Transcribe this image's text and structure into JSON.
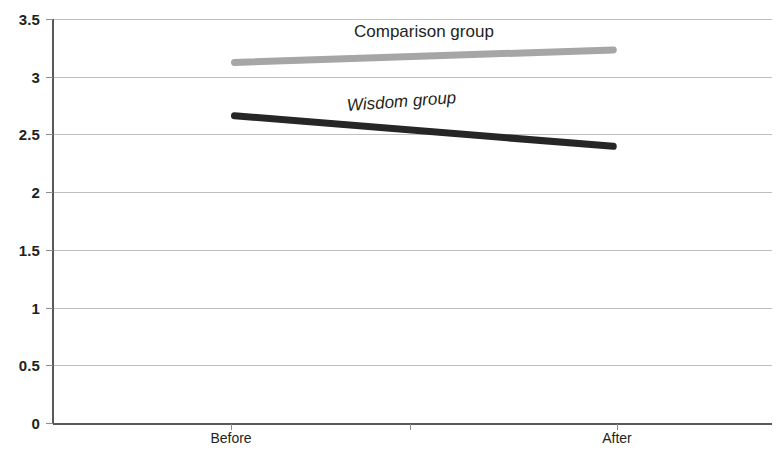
{
  "chart_data": {
    "type": "line",
    "title": "",
    "xlabel": "",
    "ylabel": "",
    "categories": [
      "Before",
      "After"
    ],
    "x": [
      0,
      1
    ],
    "ylim": [
      0,
      3.5
    ],
    "yticks": [
      0,
      0.5,
      1,
      1.5,
      2,
      2.5,
      3,
      3.5
    ],
    "ytick_labels": [
      "0",
      "0.5",
      "1",
      "1.5",
      "2",
      "2.5",
      "3",
      "3.5"
    ],
    "grid": true,
    "legend_position": "inline-annotation",
    "series": [
      {
        "name": "Comparison group",
        "values": [
          3.12,
          3.23
        ],
        "color": "#a6a6a6",
        "linewidth": 7,
        "label_style": "normal"
      },
      {
        "name": "Wisdom group",
        "values": [
          2.66,
          2.39
        ],
        "color": "#262626",
        "linewidth": 7,
        "label_style": "italic"
      }
    ],
    "annotations": [
      {
        "text": "Comparison group",
        "series": "Comparison group",
        "style": "normal"
      },
      {
        "text": "Wisdom group",
        "series": "Wisdom group",
        "style": "italic"
      }
    ]
  },
  "colors": {
    "comparison": "#a6a6a6",
    "wisdom": "#262626",
    "gridline": "#bfbfbf",
    "axis": "#595959",
    "text": "#231f20",
    "background": "#ffffff"
  }
}
